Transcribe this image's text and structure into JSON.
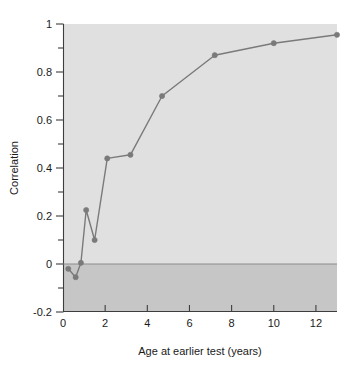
{
  "chart_data": {
    "type": "line",
    "title": "",
    "subtitle": "",
    "xlabel": "Age at earlier test (years)",
    "ylabel": "Correlation",
    "xlim": [
      0,
      13
    ],
    "ylim": [
      -0.2,
      1
    ],
    "xticks": [
      0,
      2,
      4,
      6,
      8,
      10,
      12
    ],
    "xtick_labels": [
      "0",
      "2",
      "4",
      "6",
      "8",
      "10",
      "12"
    ],
    "yticks": [
      -0.2,
      0,
      0.2,
      0.4,
      0.6,
      0.8,
      1
    ],
    "ytick_labels": [
      "-0.2",
      "0",
      "0.2",
      "0.4",
      "0.6",
      "0.8",
      "1"
    ],
    "minor_yticks": [
      -0.1,
      0.1,
      0.3,
      0.5,
      0.7,
      0.9
    ],
    "grid": false,
    "legend": null,
    "legend_position": "none",
    "series": [
      {
        "name": "Correlation with later test",
        "marker": "circle",
        "color": "#7a7a7a",
        "x": [
          0.25,
          0.6,
          0.85,
          1.1,
          1.5,
          2.1,
          3.2,
          4.7,
          7.2,
          10.0,
          13.0
        ],
        "y": [
          -0.02,
          -0.055,
          0.005,
          0.225,
          0.1,
          0.44,
          0.455,
          0.7,
          0.87,
          0.92,
          0.955
        ]
      }
    ],
    "annotations": [
      {
        "name": "zero-reference-line",
        "type": "hline",
        "y": 0,
        "color": "#8c8c8c"
      }
    ],
    "regions": [
      {
        "name": "positive-region-shading",
        "from_y": 0,
        "to_y": 1,
        "color": "#e0e0e0"
      },
      {
        "name": "negative-region-shading",
        "from_y": -0.2,
        "to_y": 0,
        "color": "#c6c6c6"
      }
    ]
  },
  "axes": {
    "x_title": "Age at earlier test (years)",
    "y_title": "Correlation"
  }
}
